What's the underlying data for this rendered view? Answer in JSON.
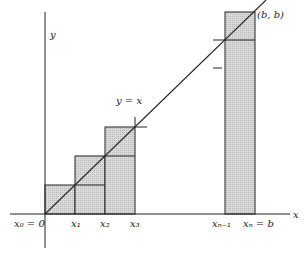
{
  "figure": {
    "curve_label": "y = x",
    "point_label": "(b, b)",
    "axes": {
      "x_label": "x",
      "y_label": "y"
    },
    "ticks": [
      {
        "label": "x0 = 0",
        "sub": "0",
        "display": "x₀ = 0"
      },
      {
        "display": "x₁"
      },
      {
        "display": "x₂"
      },
      {
        "display": "x₃"
      },
      {
        "display": "xₙ₋₁"
      },
      {
        "display": "xₙ = b"
      }
    ],
    "colors": {
      "fill": "#d4d4d4",
      "line": "#222222",
      "background": "#ffffff"
    }
  }
}
